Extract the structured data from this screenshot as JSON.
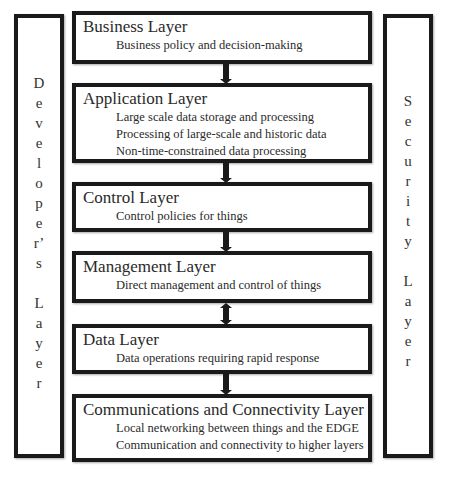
{
  "diagram": {
    "side_layers": {
      "left": {
        "label": "Developer's Layer",
        "letters": [
          "D",
          "e",
          "v",
          "e",
          "l",
          "o",
          "p",
          "e",
          "r",
          "’",
          "s",
          "",
          "L",
          "a",
          "y",
          "e",
          "r"
        ]
      },
      "right": {
        "label": "Security Layer",
        "letters": [
          "S",
          "e",
          "c",
          "u",
          "r",
          "i",
          "t",
          "y",
          "",
          "L",
          "a",
          "y",
          "e",
          "r"
        ]
      }
    },
    "layers": [
      {
        "title": "Business Layer",
        "items": [
          "Business policy and decision-making"
        ]
      },
      {
        "title": "Application Layer",
        "items": [
          "Large scale data storage and processing",
          "Processing of large-scale and historic data",
          "Non-time-constrained data processing"
        ]
      },
      {
        "title": "Control Layer",
        "items": [
          "Control policies for things"
        ]
      },
      {
        "title": "Management Layer",
        "items": [
          "Direct management and control of things"
        ]
      },
      {
        "title": "Data Layer",
        "items": [
          "Data operations requiring rapid response"
        ]
      },
      {
        "title": "Communications and Connectivity Layer",
        "items": [
          "Local networking between things and the EDGE",
          "Communication and connectivity to higher layers"
        ]
      }
    ],
    "connectors": [
      {
        "from": "Business Layer",
        "to": "Application Layer",
        "direction": "down"
      },
      {
        "from": "Application Layer",
        "to": "Control Layer",
        "direction": "down"
      },
      {
        "from": "Control Layer",
        "to": "Management Layer",
        "direction": "down"
      },
      {
        "from": "Management Layer",
        "to": "Data Layer",
        "direction": "both"
      },
      {
        "from": "Data Layer",
        "to": "Communications and Connectivity Layer",
        "direction": "down"
      }
    ],
    "colors": {
      "border": "#1a1a1a",
      "background": "#ffffff",
      "text": "#2a2a2a"
    }
  }
}
